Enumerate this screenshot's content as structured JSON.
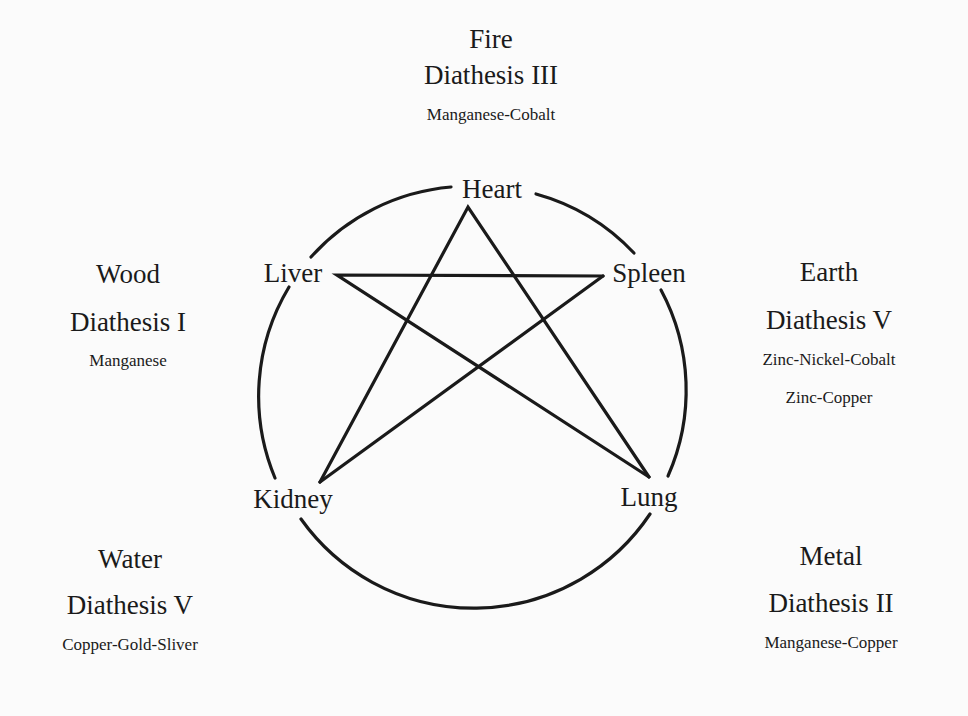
{
  "elements": {
    "fire": {
      "name": "Fire",
      "diathesis": "Diathesis III",
      "minerals": [
        "Manganese-Cobalt"
      ]
    },
    "wood": {
      "name": "Wood",
      "diathesis": "Diathesis I",
      "minerals": [
        "Manganese"
      ]
    },
    "earth": {
      "name": "Earth",
      "diathesis": "Diathesis V",
      "minerals": [
        "Zinc-Nickel-Cobalt",
        "Zinc-Copper"
      ]
    },
    "water": {
      "name": "Water",
      "diathesis": "Diathesis V",
      "minerals": [
        "Copper-Gold-Sliver"
      ]
    },
    "metal": {
      "name": "Metal",
      "diathesis": "Diathesis II",
      "minerals": [
        "Manganese-Copper"
      ]
    }
  },
  "organs": {
    "heart": "Heart",
    "liver": "Liver",
    "spleen": "Spleen",
    "kidney": "Kidney",
    "lung": "Lung"
  },
  "colors": {
    "background": "#fbfbfb",
    "ink": "#1a1a1a"
  }
}
